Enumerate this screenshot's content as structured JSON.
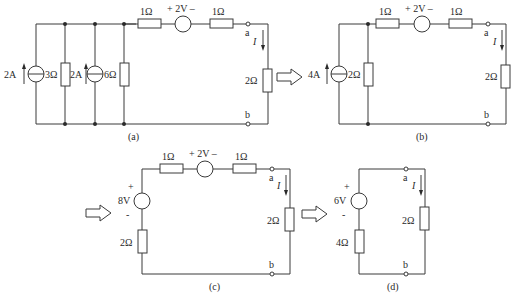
{
  "figure": {
    "caption_faint": "",
    "circuits": {
      "a": {
        "label": "(a)",
        "source1": "2A",
        "r1": "3Ω",
        "source2": "2A",
        "r2": "6Ω",
        "series_r1": "1Ω",
        "vsrc": "+ 2V –",
        "series_r2": "1Ω",
        "node_a": "a",
        "node_b": "b",
        "current": "I",
        "load": "2Ω"
      },
      "b": {
        "label": "(b)",
        "source": "4A",
        "r_parallel": "2Ω",
        "series_r1": "1Ω",
        "vsrc": "+ 2V –",
        "series_r2": "1Ω",
        "node_a": "a",
        "node_b": "b",
        "current": "I",
        "load": "2Ω"
      },
      "c": {
        "label": "(c)",
        "vsrc_plus": "+",
        "vsrc_value": "8V",
        "vsrc_minus": "-",
        "r_series_left": "2Ω",
        "series_r1": "1Ω",
        "vsrc2": "+ 2V –",
        "series_r2": "1Ω",
        "node_a": "a",
        "node_b": "b",
        "current": "I",
        "load": "2Ω"
      },
      "d": {
        "label": "(d)",
        "vsrc_plus": "+",
        "vsrc_value": "6V",
        "vsrc_minus": "-",
        "r_series": "4Ω",
        "node_a": "a",
        "node_b": "b",
        "current": "I",
        "load": "2Ω"
      }
    }
  }
}
